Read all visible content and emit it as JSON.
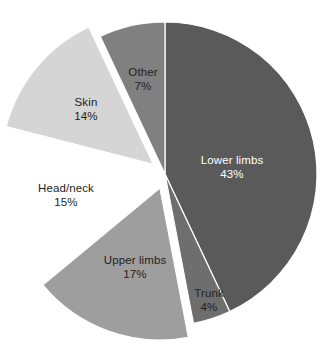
{
  "chart_data": {
    "type": "pie",
    "title": "",
    "subtitle": "",
    "xlabel": "",
    "ylabel": "",
    "legend": "none",
    "grid": false,
    "units": "percent",
    "categories": [
      "Lower limbs",
      "Trunk",
      "Upper limbs",
      "Head/neck",
      "Skin",
      "Other"
    ],
    "values": [
      43,
      4,
      17,
      15,
      14,
      7
    ],
    "slices": [
      {
        "label": "Lower limbs",
        "value": 43,
        "value_text": "43%",
        "color": "#5a5a5a",
        "exploded": false,
        "label_color": "#ffffff",
        "label_x": 232,
        "label_y": 168
      },
      {
        "label": "Trunk",
        "value": 4,
        "value_text": "4%",
        "color": "#6e6e6e",
        "exploded": false,
        "label_color": "#231f20",
        "label_x": 209,
        "label_y": 301
      },
      {
        "label": "Upper limbs",
        "value": 17,
        "value_text": "17%",
        "color": "#9e9e9e",
        "exploded": true,
        "label_color": "#231f20",
        "label_x": 135,
        "label_y": 268
      },
      {
        "label": "Head/neck",
        "value": 15,
        "value_text": "15%",
        "color": "#ffffff",
        "exploded": true,
        "label_color": "#231f20",
        "label_x": 66,
        "label_y": 196
      },
      {
        "label": "Skin",
        "value": 14,
        "value_text": "14%",
        "color": "#d5d5d5",
        "exploded": true,
        "label_color": "#231f20",
        "label_x": 86,
        "label_y": 110
      },
      {
        "label": "Other",
        "value": 7,
        "value_text": "7%",
        "color": "#808080",
        "exploded": false,
        "label_color": "#231f20",
        "label_x": 143,
        "label_y": 80
      }
    ],
    "total": 100,
    "background": "#ffffff"
  }
}
